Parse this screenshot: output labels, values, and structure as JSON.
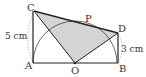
{
  "figure": {
    "points": {
      "A": "A",
      "B": "B",
      "C": "C",
      "D": "D",
      "O": "O",
      "P": "P"
    },
    "measurements": {
      "AC": "5 cm",
      "BD": "3 cm"
    },
    "colors": {
      "shade": "#d4d4d4",
      "stroke": "#333333",
      "dotted": "#aaaaaa"
    }
  }
}
